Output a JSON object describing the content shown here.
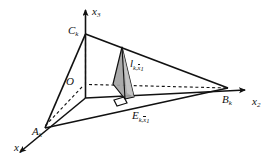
{
  "figure": {
    "background_color": "#ffffff",
    "line_color": "#111111",
    "shade_fill": "#a8a8a8",
    "shade_fill_light": "#cfcfcf",
    "axes": [
      {
        "name": "x3",
        "label_base": "x",
        "label_sub": "3",
        "x": 92,
        "y": 6
      },
      {
        "name": "x2",
        "label_base": "x",
        "label_sub": "2",
        "x": 252,
        "y": 96
      },
      {
        "name": "x1",
        "label_base": "x",
        "label_sub": "1",
        "x": 14,
        "y": 142
      }
    ],
    "points": [
      {
        "name": "origin",
        "label_base": "O",
        "label_sub": "",
        "x": 66,
        "y": 76
      },
      {
        "name": "vertex-c",
        "label_base": "C",
        "label_sub": "k",
        "x": 68,
        "y": 25
      },
      {
        "name": "vertex-b",
        "label_base": "B",
        "label_sub": "k",
        "x": 222,
        "y": 94
      },
      {
        "name": "vertex-a",
        "label_base": "A",
        "label_sub": "k",
        "x": 32,
        "y": 126
      }
    ],
    "annotations": [
      {
        "name": "segment-length-label",
        "base": "l",
        "sub_k": "k,",
        "sub_x_over": "x",
        "sub_idx": "1",
        "x": 130,
        "y": 58
      },
      {
        "name": "foot-point-label",
        "base": "E",
        "sub_k": "k,",
        "sub_x_over": "x",
        "sub_idx": "1",
        "x": 132,
        "y": 110
      }
    ],
    "right_angle_marker": {
      "name": "right-angle-marker",
      "x": 120,
      "y": 100
    }
  }
}
